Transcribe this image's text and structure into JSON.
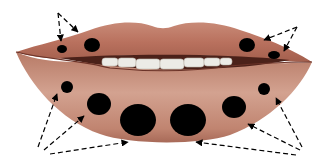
{
  "figure": {
    "colors": {
      "background": "#ffffff",
      "upper_lip": "#b9715e",
      "upper_lip_highlight": "#cf9584",
      "lower_lip": "#c58b77",
      "lower_lip_edge": "#a0614f",
      "mouth_line": "#5a2a22",
      "teeth": "#ecebe6",
      "dots": "#000000",
      "arrows": "#000000"
    },
    "dots": [
      {
        "id": "upper-left-small",
        "cx": 62,
        "cy": 49,
        "rx": 5,
        "ry": 4
      },
      {
        "id": "upper-left-large",
        "cx": 92,
        "cy": 45,
        "rx": 8,
        "ry": 7
      },
      {
        "id": "upper-right-large",
        "cx": 247,
        "cy": 45,
        "rx": 8,
        "ry": 7
      },
      {
        "id": "upper-right-small",
        "cx": 274,
        "cy": 55,
        "rx": 6,
        "ry": 4
      },
      {
        "id": "lower-left-1",
        "cx": 67,
        "cy": 87,
        "rx": 6,
        "ry": 6
      },
      {
        "id": "lower-left-2",
        "cx": 99,
        "cy": 104,
        "rx": 12,
        "ry": 11
      },
      {
        "id": "lower-center-left",
        "cx": 138,
        "cy": 120,
        "rx": 18,
        "ry": 16
      },
      {
        "id": "lower-center-right",
        "cx": 188,
        "cy": 120,
        "rx": 18,
        "ry": 16
      },
      {
        "id": "lower-right-2",
        "cx": 234,
        "cy": 107,
        "rx": 12,
        "ry": 11
      },
      {
        "id": "lower-right-1",
        "cx": 264,
        "cy": 89,
        "rx": 6,
        "ry": 6
      }
    ],
    "arrow_groups": [
      {
        "origin": [
          58,
          13
        ],
        "targets": [
          [
            61,
            41
          ],
          [
            78,
            32
          ]
        ]
      },
      {
        "origin": [
          297,
          27
        ],
        "targets": [
          [
            264,
            40
          ],
          [
            284,
            51
          ]
        ]
      },
      {
        "origin": [
          38,
          147
        ],
        "targets": [
          [
            57,
            94
          ],
          [
            84,
            107
          ]
        ]
      },
      {
        "origin": [
          50,
          154
        ],
        "targets": [
          [
            128,
            140
          ]
        ]
      },
      {
        "origin": [
          302,
          147
        ],
        "targets": [
          [
            276,
            98
          ],
          [
            248,
            124
          ]
        ]
      },
      {
        "origin": [
          296,
          155
        ],
        "targets": [
          [
            196,
            142
          ]
        ]
      }
    ]
  }
}
